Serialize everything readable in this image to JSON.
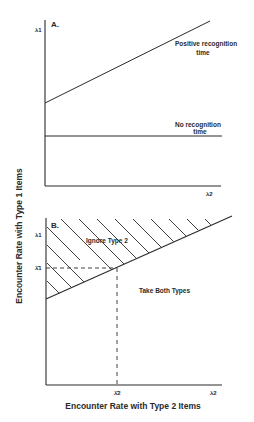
{
  "figure": {
    "y_axis_title": "Encounter Rate with Type 1 Items",
    "x_axis_title": "Encounter Rate with Type 2 Items",
    "panel_a": {
      "label": "A.",
      "y_axis_label": "λ1",
      "x_axis_label": "λ2",
      "curves": [
        {
          "name": "positive-recognition-time",
          "label_line1": "Positive recognition",
          "label_line2": "time"
        },
        {
          "name": "no-recognition-time",
          "label_line1": "No recognition",
          "label_line2": "time"
        }
      ]
    },
    "panel_b": {
      "label": "B.",
      "y_axis_label": "λ1",
      "y_threshold_label": "λ̂1",
      "x_threshold_label": "λ̂2",
      "x_axis_label": "λ2",
      "region_above": "Ignore Type 2",
      "region_below": "Take Both Types"
    },
    "colors": {
      "ink": "#2a2a2a",
      "background": "#ffffff"
    }
  }
}
